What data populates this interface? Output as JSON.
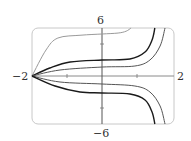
{
  "chart_data": {
    "type": "line",
    "title": "",
    "xlabel": "",
    "ylabel": "",
    "xlim": [
      -2,
      2
    ],
    "ylim": [
      -6,
      6
    ],
    "grid": false,
    "legend": null,
    "tick_labels": {
      "x_min": "−2",
      "x_max": "2",
      "y_max": "6",
      "y_min": "−6"
    },
    "x_ticks": [
      -1,
      1
    ],
    "y_ticks": [
      -4,
      4
    ],
    "series": [
      {
        "name": "curve-1",
        "color": "#9a9a9a",
        "width": 1,
        "points": [
          [
            -2,
            0
          ],
          [
            -1.6,
            3.25
          ],
          [
            -1.26,
            4.75
          ],
          [
            -0.6,
            5.1
          ],
          [
            0,
            5.25
          ],
          [
            0.46,
            5.37
          ],
          [
            0.69,
            5.6
          ],
          [
            0.83,
            6
          ]
        ]
      },
      {
        "name": "curve-2",
        "color": "#1a1a1a",
        "width": 1.4,
        "points": [
          [
            -2,
            0
          ],
          [
            -1.49,
            1
          ],
          [
            -0.91,
            1.75
          ],
          [
            0,
            2
          ],
          [
            0.8,
            2.12
          ],
          [
            1.23,
            3
          ],
          [
            1.43,
            4.5
          ],
          [
            1.51,
            6
          ]
        ]
      },
      {
        "name": "curve-3",
        "color": "#555555",
        "width": 1,
        "points": [
          [
            -2,
            0
          ],
          [
            -1.2,
            0.75
          ],
          [
            0,
            1.12
          ],
          [
            0.94,
            1.25
          ],
          [
            1.37,
            2
          ],
          [
            1.66,
            3.75
          ],
          [
            1.8,
            6
          ]
        ]
      },
      {
        "name": "curve-4",
        "color": "#555555",
        "width": 1,
        "points": [
          [
            -2,
            0
          ],
          [
            -1.2,
            -0.75
          ],
          [
            0,
            -1
          ],
          [
            0.94,
            -1.25
          ],
          [
            1.37,
            -2
          ],
          [
            1.66,
            -3.75
          ],
          [
            1.8,
            -6
          ]
        ]
      },
      {
        "name": "curve-5",
        "color": "#1a1a1a",
        "width": 1.4,
        "points": [
          [
            -2,
            0
          ],
          [
            -1.34,
            -1.25
          ],
          [
            -0.63,
            -2
          ],
          [
            0,
            -2.12
          ],
          [
            0.8,
            -2.25
          ],
          [
            1.23,
            -3
          ],
          [
            1.43,
            -4.5
          ],
          [
            1.51,
            -6
          ]
        ]
      }
    ]
  },
  "plot": {
    "frame_color": "#c8c8c8",
    "axis_color": "#8a8a8a"
  }
}
